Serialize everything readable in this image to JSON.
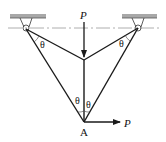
{
  "diagram": {
    "type": "truss-force-diagram",
    "labels": {
      "load_top": "P",
      "load_right": "P",
      "node_bottom": "A",
      "angle_left_support": "θ",
      "angle_right_support": "θ",
      "angle_bottom_left": "θ",
      "angle_bottom_right": "θ"
    },
    "nodes": {
      "left_support": [
        26,
        29
      ],
      "right_support": [
        138,
        28
      ],
      "middle_joint": [
        84,
        60
      ],
      "A": [
        84,
        122
      ]
    },
    "colors": {
      "line": "#1a1a1a",
      "ceiling": "#a8a8a8",
      "centerline": "#9a9a9a"
    }
  }
}
